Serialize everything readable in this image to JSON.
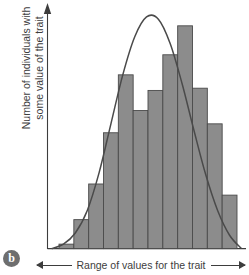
{
  "figure": {
    "panel_label": "b",
    "axis_colors": {
      "bar_fill": "#8c8c8c",
      "bar_stroke": "#4a4a4a",
      "curve": "#4a4a4a",
      "axis": "#3d3d3d",
      "background": "#ffffff"
    },
    "ylabel_line1": "Number of individuals with",
    "ylabel_line2": "some value of the trait",
    "xlabel": "Range of values for the trait"
  },
  "chart_data": {
    "type": "bar",
    "title": "",
    "subtitle": "",
    "xlabel": "Range of values for the trait",
    "ylabel": "Number of individuals with some value of the trait",
    "categories": [
      "1",
      "2",
      "3",
      "4",
      "5",
      "6",
      "7",
      "8",
      "9",
      "10",
      "11",
      "12"
    ],
    "values": [
      2,
      13,
      29,
      52,
      78,
      62,
      71,
      87,
      100,
      72,
      56,
      24
    ],
    "ylim": [
      0,
      100
    ],
    "xlim": [
      0,
      12
    ],
    "grid": false,
    "legend": false,
    "tick_labels_shown": false,
    "overlay": {
      "type": "line",
      "name": "normal distribution curve",
      "description": "smooth bell-shaped normal curve overlaid on histogram",
      "mean_category_index": 6.0,
      "peak_value": 104,
      "x": [
        -0.5,
        0.3,
        1.1,
        1.9,
        2.7,
        3.5,
        4.3,
        5.1,
        5.9,
        6.7,
        7.5,
        8.3,
        9.1,
        9.9,
        10.7,
        11.5,
        12.3
      ],
      "y": [
        0,
        2,
        7,
        17,
        34,
        56,
        78,
        95,
        104,
        103,
        92,
        74,
        53,
        33,
        17,
        6,
        0
      ]
    }
  }
}
